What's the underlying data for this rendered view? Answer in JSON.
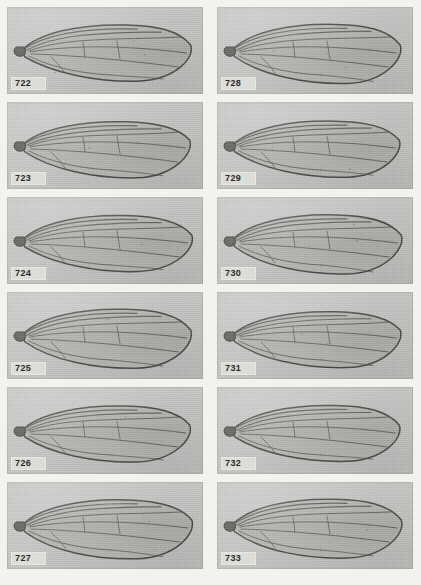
{
  "plate": {
    "name": "wing-venation-plate",
    "background_color": "#f3f2ef",
    "panel_background_color": "#c7c7c5",
    "label_background_color": "#dcdcd8",
    "label_text_color": "#2b2b2b",
    "columns": 2,
    "rows": 6
  },
  "panels": [
    {
      "figure": "722",
      "column": "left",
      "row": 1,
      "alt": "fly wing venation micrograph"
    },
    {
      "figure": "728",
      "column": "right",
      "row": 1,
      "alt": "fly wing venation micrograph"
    },
    {
      "figure": "723",
      "column": "left",
      "row": 2,
      "alt": "fly wing venation micrograph"
    },
    {
      "figure": "729",
      "column": "right",
      "row": 2,
      "alt": "fly wing venation micrograph"
    },
    {
      "figure": "724",
      "column": "left",
      "row": 3,
      "alt": "fly wing venation micrograph"
    },
    {
      "figure": "730",
      "column": "right",
      "row": 3,
      "alt": "fly wing venation micrograph"
    },
    {
      "figure": "725",
      "column": "left",
      "row": 4,
      "alt": "fly wing venation micrograph"
    },
    {
      "figure": "731",
      "column": "right",
      "row": 4,
      "alt": "fly wing venation micrograph"
    },
    {
      "figure": "726",
      "column": "left",
      "row": 5,
      "alt": "fly wing venation micrograph"
    },
    {
      "figure": "732",
      "column": "right",
      "row": 5,
      "alt": "fly wing venation micrograph"
    },
    {
      "figure": "727",
      "column": "left",
      "row": 6,
      "alt": "fly wing venation micrograph"
    },
    {
      "figure": "733",
      "column": "right",
      "row": 6,
      "alt": "fly wing venation micrograph"
    }
  ]
}
